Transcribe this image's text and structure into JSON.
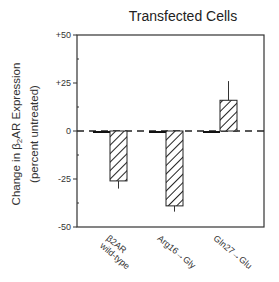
{
  "chart_data": {
    "type": "bar",
    "title": "Transfected Cells",
    "xlabel": "",
    "ylabel": "Change in β2AR Expression (percent untreated)",
    "ylabel_line1": "Change in β",
    "ylabel_sub": "2",
    "ylabel_line1_rest": "AR Expression",
    "ylabel_line2": "(percent untreated)",
    "ylim": [
      -50,
      50
    ],
    "yticks": [
      "+50",
      "+25",
      "0",
      "-25",
      "-50"
    ],
    "ytick_values": [
      50,
      25,
      0,
      -25,
      -50
    ],
    "zero_line": "dashed",
    "grid": false,
    "categories": [
      "β2AR wild-type",
      "Arg16→Gly",
      "Gln27→Glu"
    ],
    "category_labels": [
      {
        "line1": "β2AR",
        "line2": "wild-type"
      },
      {
        "line1": "Arg16→Gly",
        "line2": ""
      },
      {
        "line1": "Gln27→Glu",
        "line2": ""
      }
    ],
    "series": [
      {
        "name": "control (solid)",
        "fill": "solid black",
        "values": [
          -1,
          -1,
          -1
        ],
        "errors": [
          0,
          0,
          0
        ]
      },
      {
        "name": "treated (hatched)",
        "fill": "diagonal hatch",
        "values": [
          -26,
          -39,
          16
        ],
        "errors": [
          4,
          3,
          10
        ]
      }
    ]
  }
}
